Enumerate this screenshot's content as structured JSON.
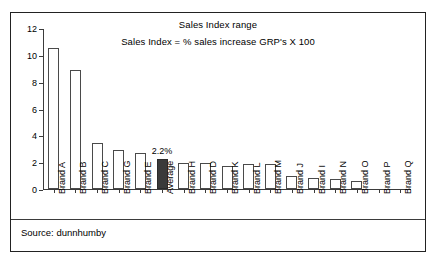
{
  "chart_data": {
    "type": "bar",
    "title": "Sales Index range",
    "subtitle": "Sales Index = % sales increase GRP's X 100",
    "xlabel": "",
    "ylabel": "",
    "ylim": [
      0,
      12
    ],
    "yticks": [
      0,
      2,
      4,
      6,
      8,
      10,
      12
    ],
    "ytick_labels": [
      "0",
      "2",
      "4",
      "6",
      "8",
      "10",
      "12"
    ],
    "grid": false,
    "legend": false,
    "categories": [
      "Brand A",
      "Brand B",
      "Brand C",
      "Brand G",
      "Brand E",
      "Average",
      "Brand H",
      "Brand D",
      "Brand K",
      "Brand L",
      "Brand M",
      "Brand J",
      "Brand I",
      "Brand N",
      "Brand O",
      "Brand P",
      "Brand Q"
    ],
    "values": [
      10.5,
      8.9,
      3.45,
      2.9,
      2.7,
      2.2,
      1.95,
      1.95,
      1.75,
      1.85,
      1.85,
      1.0,
      0.85,
      0.75,
      0.6,
      0.0,
      0.0
    ],
    "highlight_category": "Average",
    "annotations": [
      {
        "category": "Average",
        "text": "2.2%"
      }
    ],
    "colors": {
      "bar_fill": "#ffffff",
      "bar_edge": "#4a4a4a",
      "highlight_fill": "#3a3a3a",
      "axis": "#3b3b3b",
      "text": "#000000",
      "frame": "#222222"
    }
  },
  "footer": {
    "source_text": "Source: dunnhumby"
  }
}
